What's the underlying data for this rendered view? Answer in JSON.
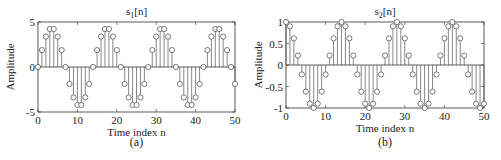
{
  "chart_data": [
    {
      "type": "stem",
      "title": "s1[n]",
      "title_main": "s",
      "title_sub": "1",
      "title_suffix": "[n]",
      "xlabel": "Time index n",
      "ylabel": "Amplitude",
      "caption": "(a)",
      "xlim": [
        0,
        50
      ],
      "ylim": [
        -5,
        5
      ],
      "xticks": [
        "0",
        "10",
        "20",
        "30",
        "40",
        "50"
      ],
      "yticks": [
        "-5",
        "0",
        "5"
      ],
      "x": [
        0,
        1,
        2,
        3,
        4,
        5,
        6,
        7,
        8,
        9,
        10,
        11,
        12,
        13,
        14,
        15,
        16,
        17,
        18,
        19,
        20,
        21,
        22,
        23,
        24,
        25,
        26,
        27,
        28,
        29,
        30,
        31,
        32,
        33,
        34,
        35,
        36,
        37,
        38,
        39,
        40,
        41,
        42,
        43,
        44,
        45,
        46,
        47,
        48,
        49,
        50
      ],
      "values": [
        0,
        1.88,
        3.38,
        4.22,
        4.22,
        3.38,
        1.88,
        0,
        -1.88,
        -3.38,
        -4.22,
        -4.22,
        -3.38,
        -1.88,
        0,
        1.88,
        3.38,
        4.22,
        4.22,
        3.38,
        1.88,
        0,
        -1.88,
        -3.38,
        -4.22,
        -4.22,
        -3.38,
        -1.88,
        0,
        1.88,
        3.38,
        4.22,
        4.22,
        3.38,
        1.88,
        0,
        -1.88,
        -3.38,
        -4.22,
        -4.22,
        -3.38,
        -1.88,
        0,
        1.88,
        3.38,
        4.22,
        4.22,
        3.38,
        1.88,
        0,
        -1.88
      ]
    },
    {
      "type": "stem",
      "title": "s2[n]",
      "title_main": "s",
      "title_sub": "2",
      "title_suffix": "[n]",
      "xlabel": "Time index n",
      "ylabel": "Amplitude",
      "caption": "(b)",
      "xlim": [
        0,
        50
      ],
      "ylim": [
        -1,
        1
      ],
      "xticks": [
        "0",
        "10",
        "20",
        "30",
        "40",
        "50"
      ],
      "yticks": [
        "-1",
        "-0.5",
        "0",
        "0.5",
        "1"
      ],
      "x": [
        0,
        1,
        2,
        3,
        4,
        5,
        6,
        7,
        8,
        9,
        10,
        11,
        12,
        13,
        14,
        15,
        16,
        17,
        18,
        19,
        20,
        21,
        22,
        23,
        24,
        25,
        26,
        27,
        28,
        29,
        30,
        31,
        32,
        33,
        34,
        35,
        36,
        37,
        38,
        39,
        40,
        41,
        42,
        43,
        44,
        45,
        46,
        47,
        48,
        49,
        50
      ],
      "values": [
        1,
        0.9,
        0.62,
        0.22,
        -0.22,
        -0.62,
        -0.9,
        -1,
        -0.9,
        -0.62,
        -0.22,
        0.22,
        0.62,
        0.9,
        1,
        0.9,
        0.62,
        0.22,
        -0.22,
        -0.62,
        -0.9,
        -1,
        -0.9,
        -0.62,
        -0.22,
        0.22,
        0.62,
        0.9,
        1,
        0.9,
        0.62,
        0.22,
        -0.22,
        -0.62,
        -0.9,
        -1,
        -0.9,
        -0.62,
        -0.22,
        0.22,
        0.62,
        0.9,
        1,
        0.9,
        0.62,
        0.22,
        -0.22,
        -0.62,
        -0.9,
        -1,
        -0.9
      ]
    }
  ],
  "colors": {
    "axis": "#333333",
    "stem": "#555555",
    "marker": "#444444",
    "background": "#ffffff"
  }
}
